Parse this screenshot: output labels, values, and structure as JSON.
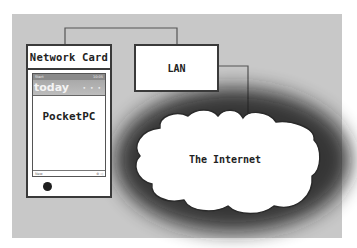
{
  "diagram": {
    "nodes": {
      "network_card": {
        "label": "Network Card"
      },
      "pocketpc": {
        "status_left": "Start",
        "status_right": "10:05",
        "today_label": "today",
        "today_dots": "• • •",
        "label": "PocketPC",
        "bottom_left": "New",
        "bottom_right": "⊕ ◁"
      },
      "lan": {
        "label": "LAN"
      },
      "internet": {
        "label": "The Internet"
      }
    },
    "edges": [
      {
        "from": "network_card",
        "to": "lan"
      },
      {
        "from": "lan",
        "to": "internet"
      }
    ],
    "colors": {
      "background": "#c8c8c8",
      "box_fill": "#ffffff",
      "stroke": "#3a3a3a"
    }
  }
}
